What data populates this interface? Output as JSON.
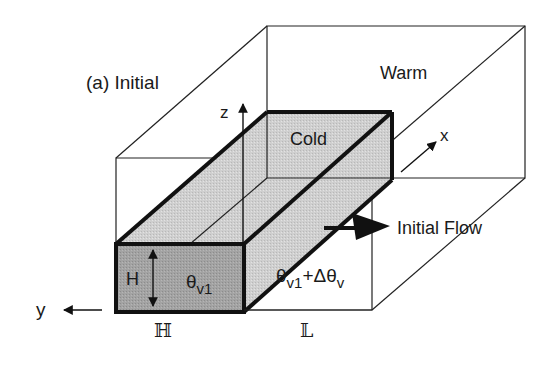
{
  "figure": {
    "panel_label": "(a) Initial",
    "regions": {
      "warm": "Warm",
      "cold": "Cold"
    },
    "axes": {
      "x": "x",
      "y": "y",
      "z": "z"
    },
    "flow_label": "Initial Flow",
    "height_label": "H",
    "theta_inside": "θ",
    "theta_inside_sub": "v1",
    "theta_outside_base": "θ",
    "theta_outside_sub1": "v1",
    "theta_outside_plus": "+Δθ",
    "theta_outside_sub2": "v",
    "dimension_width": "ℍ",
    "dimension_length": "𝕃",
    "colors": {
      "cold_top": "#c9c9c9",
      "cold_front": "#9a9a9a",
      "cold_side": "#d4d4d4",
      "line": "#111111",
      "background": "#ffffff"
    }
  }
}
